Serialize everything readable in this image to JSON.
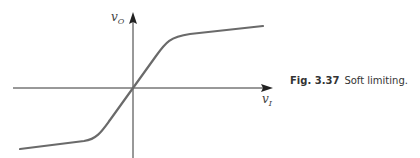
{
  "figure": {
    "number": "Fig. 3.37",
    "caption": "Soft limiting.",
    "x_axis_label": {
      "base": "v",
      "sub": "I"
    },
    "y_axis_label": {
      "base": "v",
      "sub": "O"
    },
    "colors": {
      "axes": "#333333",
      "curve": "#6a6a6a"
    }
  }
}
